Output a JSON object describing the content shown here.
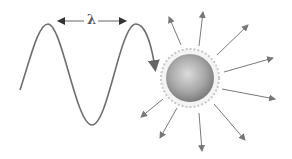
{
  "diagram": {
    "wavelength_label": "λ",
    "colors": {
      "wave": "#6e6e6e",
      "arrows": "#7a7a7a",
      "sphere_light": "#d6d6d6",
      "sphere_dark": "#7c7c7c",
      "halo": "#c4c4c4"
    },
    "components": [
      {
        "id": "incident-wave",
        "label": "incident sine wave"
      },
      {
        "id": "wavelength-marker",
        "label": "λ"
      },
      {
        "id": "particle",
        "label": "spherical particle"
      },
      {
        "id": "scattered-rays",
        "count": 9
      }
    ]
  }
}
